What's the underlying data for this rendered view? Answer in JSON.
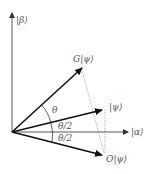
{
  "diagram": {
    "axes": {
      "vertical_label": "|β⟩",
      "horizontal_label": "|α⟩"
    },
    "vectors": [
      {
        "name": "G|ψ⟩",
        "label": "G|ψ⟩"
      },
      {
        "name": "|ψ⟩",
        "label": "|ψ⟩"
      },
      {
        "name": "O|ψ⟩",
        "label": "O|ψ⟩"
      }
    ],
    "angles": {
      "theta": "θ",
      "half_theta_upper": "θ/2",
      "half_theta_lower": "θ/2"
    },
    "colors": {
      "vector": "#111111",
      "axis": "#444444",
      "label": "#555555",
      "dotted": "#888888"
    }
  }
}
